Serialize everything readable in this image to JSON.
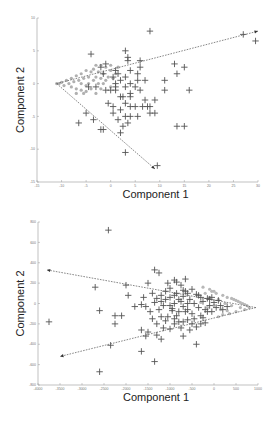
{
  "chart_data": [
    {
      "type": "scatter",
      "title": "",
      "xlabel": "Component 1",
      "ylabel": "Component 2",
      "xlim": [
        -15,
        30
      ],
      "ylim": [
        -15,
        10
      ],
      "xticks": [
        -15,
        -10,
        -5,
        0,
        5,
        10,
        15,
        20,
        25,
        30
      ],
      "yticks": [
        10,
        5,
        0,
        -5,
        -10,
        -15
      ],
      "grid": false,
      "legend": null,
      "frame": {
        "left": 37,
        "top": 18,
        "right": 258,
        "bottom": 182
      },
      "series": [
        {
          "name": "crosses",
          "marker": "+",
          "color": "#555555",
          "points": [
            [
              8,
              8
            ],
            [
              27,
              7.5
            ],
            [
              29.5,
              6.5
            ],
            [
              -4,
              4.5
            ],
            [
              3,
              5
            ],
            [
              3.5,
              4
            ],
            [
              3.5,
              3.5
            ],
            [
              6,
              3.5
            ],
            [
              6,
              2.5
            ],
            [
              13,
              3
            ],
            [
              15,
              2.5
            ],
            [
              -1,
              3
            ],
            [
              -2,
              2.5
            ],
            [
              1,
              2
            ],
            [
              0.5,
              1
            ],
            [
              -1.5,
              1.5
            ],
            [
              1.5,
              1.5
            ],
            [
              4,
              2
            ],
            [
              5.5,
              1.5
            ],
            [
              3,
              1
            ],
            [
              5.5,
              0.5
            ],
            [
              11,
              0.5
            ],
            [
              13.5,
              1.5
            ],
            [
              16,
              -1
            ],
            [
              1,
              0
            ],
            [
              2,
              0.5
            ],
            [
              4,
              0
            ],
            [
              3,
              -0.5
            ],
            [
              5,
              -0.5
            ],
            [
              7,
              0.5
            ],
            [
              -4.5,
              -0.5
            ],
            [
              -3,
              -0.5
            ],
            [
              -1,
              -1
            ],
            [
              0,
              -1
            ],
            [
              1,
              -0.5
            ],
            [
              2,
              -2
            ],
            [
              4,
              -1.5
            ],
            [
              2.5,
              -2
            ],
            [
              4,
              -2
            ],
            [
              6,
              -1
            ],
            [
              1,
              -1
            ],
            [
              7,
              -2.5
            ],
            [
              9,
              -2.5
            ],
            [
              3,
              -3
            ],
            [
              4,
              -3.5
            ],
            [
              5,
              -3.5
            ],
            [
              6.5,
              -3.5
            ],
            [
              7.5,
              -3.5
            ],
            [
              8,
              -3.5
            ],
            [
              11,
              -1
            ],
            [
              -0.5,
              -3
            ],
            [
              0.5,
              -3.5
            ],
            [
              2,
              -4
            ],
            [
              4,
              -5
            ],
            [
              8,
              -4.5
            ],
            [
              9,
              -4.5
            ],
            [
              -5,
              -4.5
            ],
            [
              -6.5,
              -6
            ],
            [
              -2,
              -7
            ],
            [
              5.5,
              -5
            ],
            [
              3,
              -5
            ],
            [
              -3.5,
              -5.5
            ],
            [
              2.5,
              -6.5
            ],
            [
              2,
              -7.5
            ],
            [
              3.5,
              -6
            ],
            [
              13.5,
              -6.5
            ],
            [
              15,
              -6.5
            ],
            [
              -1.5,
              -7
            ],
            [
              3,
              -10.5
            ],
            [
              9.5,
              -12.5
            ],
            [
              0.5,
              -4.5
            ],
            [
              1.5,
              -5.5
            ]
          ]
        },
        {
          "name": "dots",
          "marker": "o",
          "color": "#b0b0b0",
          "points": [
            [
              -11,
              0
            ],
            [
              -10.5,
              0
            ],
            [
              -10,
              0.2
            ],
            [
              -9.5,
              -0.3
            ],
            [
              -9,
              0.5
            ],
            [
              -8.5,
              0
            ],
            [
              -8,
              0.8
            ],
            [
              -8,
              -0.5
            ],
            [
              -7.5,
              0.3
            ],
            [
              -7,
              1.2
            ],
            [
              -7,
              -0.8
            ],
            [
              -6.5,
              0.5
            ],
            [
              -6,
              1.5
            ],
            [
              -6,
              0
            ],
            [
              -6,
              -1
            ],
            [
              -5.5,
              0.8
            ],
            [
              -5,
              2
            ],
            [
              -5,
              -0.3
            ],
            [
              -5,
              -1.2
            ],
            [
              -4.5,
              1
            ],
            [
              -4.5,
              0
            ],
            [
              -4,
              1.8
            ],
            [
              -4,
              -0.8
            ],
            [
              -3.5,
              0.5
            ],
            [
              -3.5,
              2.2
            ],
            [
              -3,
              1
            ],
            [
              -3,
              -1.5
            ],
            [
              -2.5,
              0
            ],
            [
              -2.5,
              1.8
            ],
            [
              -2,
              0.8
            ],
            [
              -2,
              -0.8
            ],
            [
              -1.5,
              1.5
            ],
            [
              -1.5,
              0
            ],
            [
              -1,
              2.5
            ],
            [
              -1,
              0.5
            ],
            [
              -0.5,
              1
            ],
            [
              0,
              2
            ],
            [
              0,
              -0.5
            ],
            [
              0.5,
              0.8
            ],
            [
              1,
              1.5
            ],
            [
              -3,
              2.8
            ],
            [
              -5.5,
              -1.5
            ],
            [
              -7,
              -1.5
            ],
            [
              -2,
              2.8
            ],
            [
              0,
              2.8
            ],
            [
              1.5,
              2.5
            ]
          ]
        }
      ],
      "arrows": [
        {
          "from": [
            -11,
            0
          ],
          "to": [
            30,
            8
          ]
        },
        {
          "from": [
            -11,
            0
          ],
          "to": [
            9,
            -13
          ]
        }
      ]
    },
    {
      "type": "scatter",
      "title": "",
      "xlabel": "Component 1",
      "ylabel": "Component 2",
      "xlim": [
        -4000,
        1000
      ],
      "ylim": [
        -800,
        800
      ],
      "xticks": [
        -4000,
        -3500,
        -3000,
        -2500,
        -2000,
        -1500,
        -1000,
        -500,
        0,
        500,
        1000
      ],
      "yticks": [
        800,
        600,
        400,
        200,
        0,
        -200,
        -400,
        -600,
        -800
      ],
      "grid": false,
      "legend": null,
      "frame": {
        "left": 38,
        "top": 222,
        "right": 258,
        "bottom": 385
      },
      "series": [
        {
          "name": "crosses",
          "marker": "+",
          "color": "#555555",
          "points": [
            [
              -2400,
              720
            ],
            [
              -2700,
              160
            ],
            [
              -2600,
              -70
            ],
            [
              -2250,
              -120
            ],
            [
              -2100,
              -120
            ],
            [
              -2250,
              -200
            ],
            [
              -1950,
              80
            ],
            [
              -2000,
              180
            ],
            [
              -1600,
              60
            ],
            [
              -1800,
              -30
            ],
            [
              -1650,
              -10
            ],
            [
              -1550,
              -30
            ],
            [
              -1650,
              -260
            ],
            [
              -1300,
              -310
            ],
            [
              -1550,
              -320
            ],
            [
              -3750,
              -180
            ],
            [
              -2350,
              -410
            ],
            [
              -2600,
              -670
            ],
            [
              -1350,
              330
            ],
            [
              -1250,
              300
            ],
            [
              -900,
              230
            ],
            [
              -700,
              70
            ],
            [
              -500,
              140
            ],
            [
              -300,
              60
            ],
            [
              -100,
              40
            ],
            [
              -1500,
              200
            ],
            [
              -1400,
              100
            ],
            [
              -1300,
              50
            ],
            [
              -1200,
              80
            ],
            [
              -1150,
              -20
            ],
            [
              -1100,
              120
            ],
            [
              -1000,
              60
            ],
            [
              -950,
              -50
            ],
            [
              -900,
              0
            ],
            [
              -850,
              100
            ],
            [
              -800,
              -80
            ],
            [
              -750,
              20
            ],
            [
              -700,
              -30
            ],
            [
              -650,
              120
            ],
            [
              -600,
              -60
            ],
            [
              -550,
              40
            ],
            [
              -500,
              -100
            ],
            [
              -450,
              0
            ],
            [
              -400,
              90
            ],
            [
              -350,
              -40
            ],
            [
              -300,
              -120
            ],
            [
              -250,
              20
            ],
            [
              -200,
              -60
            ],
            [
              -150,
              50
            ],
            [
              -100,
              -20
            ],
            [
              -50,
              -80
            ],
            [
              0,
              10
            ],
            [
              50,
              -40
            ],
            [
              100,
              30
            ],
            [
              150,
              -20
            ],
            [
              -1050,
              200
            ],
            [
              -850,
              210
            ],
            [
              -750,
              180
            ],
            [
              -650,
              240
            ],
            [
              -1250,
              -60
            ],
            [
              -1200,
              -130
            ],
            [
              -1100,
              -170
            ],
            [
              -1050,
              -130
            ],
            [
              -900,
              -150
            ],
            [
              -800,
              -180
            ],
            [
              -700,
              -180
            ],
            [
              -1150,
              -240
            ],
            [
              -1000,
              -250
            ],
            [
              -600,
              -160
            ],
            [
              -500,
              -200
            ],
            [
              -400,
              -230
            ],
            [
              -300,
              -200
            ],
            [
              -200,
              -190
            ],
            [
              -1400,
              -150
            ],
            [
              -1300,
              -200
            ],
            [
              -1500,
              -280
            ],
            [
              -1650,
              -470
            ],
            [
              -1350,
              -570
            ],
            [
              -1200,
              -350
            ],
            [
              -400,
              -400
            ],
            [
              -700,
              -320
            ],
            [
              -950,
              -70
            ],
            [
              -850,
              -120
            ],
            [
              -600,
              100
            ],
            [
              -1000,
              150
            ],
            [
              -1350,
              10
            ],
            [
              -1450,
              -80
            ],
            [
              -1000,
              -20
            ],
            [
              -900,
              80
            ],
            [
              -800,
              40
            ],
            [
              -700,
              130
            ],
            [
              -600,
              0
            ],
            [
              -450,
              -150
            ],
            [
              -350,
              80
            ],
            [
              -250,
              -140
            ],
            [
              -150,
              -80
            ],
            [
              -50,
              60
            ],
            [
              200,
              -60
            ],
            [
              300,
              -30
            ],
            [
              -1100,
              40
            ],
            [
              -1200,
              20
            ],
            [
              -900,
              -200
            ],
            [
              -750,
              -240
            ],
            [
              -550,
              -260
            ],
            [
              -650,
              -80
            ]
          ]
        },
        {
          "name": "dots",
          "marker": "o",
          "color": "#b8b8b8",
          "points": [
            [
              800,
              -40
            ],
            [
              750,
              -20
            ],
            [
              700,
              -60
            ],
            [
              650,
              0
            ],
            [
              600,
              -40
            ],
            [
              550,
              20
            ],
            [
              500,
              -80
            ],
            [
              450,
              40
            ],
            [
              400,
              -20
            ],
            [
              350,
              -100
            ],
            [
              300,
              60
            ],
            [
              250,
              0
            ],
            [
              200,
              80
            ],
            [
              150,
              -60
            ],
            [
              100,
              40
            ],
            [
              50,
              100
            ],
            [
              0,
              -20
            ],
            [
              -50,
              120
            ],
            [
              -100,
              60
            ],
            [
              700,
              -10
            ],
            [
              600,
              10
            ],
            [
              500,
              30
            ],
            [
              400,
              50
            ],
            [
              300,
              -70
            ],
            [
              200,
              -110
            ],
            [
              100,
              -130
            ],
            [
              0,
              120
            ],
            [
              -100,
              140
            ],
            [
              -150,
              -40
            ],
            [
              -200,
              100
            ],
            [
              -250,
              160
            ],
            [
              -300,
              10
            ]
          ]
        }
      ],
      "arrows": [
        {
          "from": [
            950,
            -40
          ],
          "to": [
            -3800,
            330
          ]
        },
        {
          "from": [
            950,
            -40
          ],
          "to": [
            -3500,
            -520
          ]
        }
      ]
    }
  ]
}
